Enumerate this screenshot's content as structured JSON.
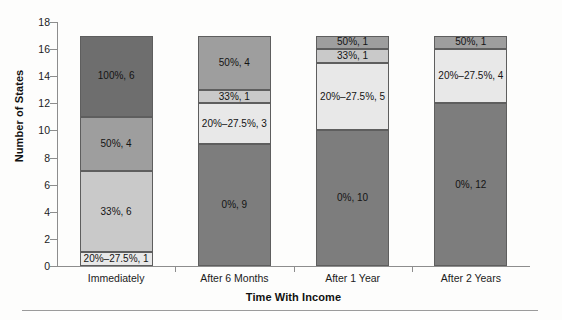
{
  "chart_data": {
    "type": "bar",
    "stacked": true,
    "title": "",
    "xlabel": "Time With Income",
    "ylabel": "Number of States",
    "ylim": [
      0,
      18
    ],
    "ytick_step": 2,
    "yticks": [
      0,
      2,
      4,
      6,
      8,
      10,
      12,
      14,
      16,
      18
    ],
    "grid": false,
    "legend": "none",
    "categories": [
      "Immediately",
      "After 6 Months",
      "After 1 Year",
      "After 2 Years"
    ],
    "series": [
      {
        "name": "0%",
        "color": "#7d7d7d",
        "values": [
          0,
          9,
          10,
          12
        ]
      },
      {
        "name": "20%-27.5%",
        "color": "#e8e8e8",
        "values": [
          1,
          3,
          5,
          4
        ]
      },
      {
        "name": "33%",
        "color": "#c9c9c9",
        "values": [
          6,
          1,
          1,
          0
        ]
      },
      {
        "name": "50%",
        "color": "#9e9e9e",
        "values": [
          4,
          4,
          1,
          1
        ]
      },
      {
        "name": "100%",
        "color": "#6e6e6e",
        "values": [
          6,
          0,
          0,
          0
        ]
      }
    ],
    "totals": [
      17,
      17,
      17,
      17
    ],
    "bars": [
      {
        "category": "Immediately",
        "total": 17,
        "segments": [
          {
            "series": "20%-27.5%",
            "value": 1,
            "label": "20%–27.5%, 1",
            "color": "#e8e8e8"
          },
          {
            "series": "33%",
            "value": 6,
            "label": "33%, 6",
            "color": "#c9c9c9"
          },
          {
            "series": "50%",
            "value": 4,
            "label": "50%, 4",
            "color": "#9e9e9e"
          },
          {
            "series": "100%",
            "value": 6,
            "label": "100%, 6",
            "color": "#6e6e6e"
          }
        ]
      },
      {
        "category": "After 6 Months",
        "total": 17,
        "segments": [
          {
            "series": "0%",
            "value": 9,
            "label": "0%, 9",
            "color": "#7d7d7d"
          },
          {
            "series": "20%-27.5%",
            "value": 3,
            "label": "20%–27.5%, 3",
            "color": "#e8e8e8"
          },
          {
            "series": "33%",
            "value": 1,
            "label": "33%, 1",
            "color": "#c9c9c9"
          },
          {
            "series": "50%",
            "value": 4,
            "label": "50%, 4",
            "color": "#9e9e9e"
          }
        ]
      },
      {
        "category": "After 1 Year",
        "total": 17,
        "segments": [
          {
            "series": "0%",
            "value": 10,
            "label": "0%, 10",
            "color": "#7d7d7d"
          },
          {
            "series": "20%-27.5%",
            "value": 5,
            "label": "20%–27.5%, 5",
            "color": "#e8e8e8"
          },
          {
            "series": "33%",
            "value": 1,
            "label": "33%, 1",
            "color": "#c9c9c9"
          },
          {
            "series": "50%",
            "value": 1,
            "label": "50%, 1",
            "color": "#9e9e9e"
          }
        ]
      },
      {
        "category": "After 2 Years",
        "total": 17,
        "segments": [
          {
            "series": "0%",
            "value": 12,
            "label": "0%, 12",
            "color": "#7d7d7d"
          },
          {
            "series": "20%-27.5%",
            "value": 4,
            "label": "20%–27.5%, 4",
            "color": "#e8e8e8"
          },
          {
            "series": "50%",
            "value": 1,
            "label": "50%, 1",
            "color": "#9e9e9e"
          }
        ]
      }
    ]
  },
  "axis": {
    "y_title": "Number of States",
    "x_title": "Time With Income",
    "y_labels": [
      "18",
      "16",
      "14",
      "12",
      "10",
      "8",
      "6",
      "4",
      "2",
      "0"
    ]
  }
}
